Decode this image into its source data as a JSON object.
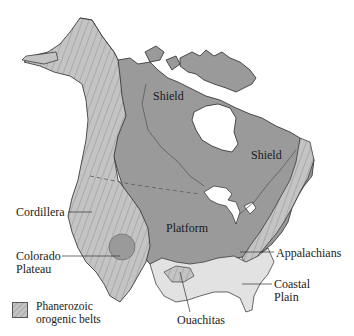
{
  "figure": {
    "type": "geologic-province-map",
    "region": "North America"
  },
  "colors": {
    "platform_shield": "#9a9a9a",
    "orogenic_belt": "#c4c4c4",
    "coastal_plain": "#e2e2e2",
    "water": "#ffffff",
    "outline": "#2a2a2a",
    "boundary_line": "#555555"
  },
  "labels": {
    "shield_west": "Shield",
    "shield_east": "Shield",
    "platform": "Platform",
    "cordillera": "Cordillera",
    "colorado_plateau_line1": "Colorado",
    "colorado_plateau_line2": "Plateau",
    "appalachians": "Appalachians",
    "coastal_plain_line1": "Coastal",
    "coastal_plain_line2": "Plain",
    "ouachitas": "Ouachitas"
  },
  "legend": {
    "items": [
      {
        "swatch": "hatched-light-gray",
        "label_line1": "Phanerozoic",
        "label_line2": "orogenic belts"
      }
    ]
  }
}
